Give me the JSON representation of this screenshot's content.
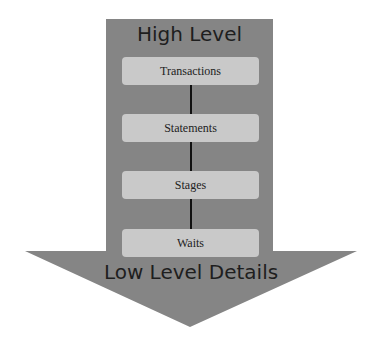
{
  "diagram": {
    "top_label": "High Level",
    "bottom_label": "Low Level Details",
    "levels": [
      {
        "label": "Transactions"
      },
      {
        "label": "Statements"
      },
      {
        "label": "Stages"
      },
      {
        "label": "Waits"
      }
    ],
    "colors": {
      "arrow_fill": "#858585",
      "box_fill": "#c9c9c9",
      "connector": "#111111",
      "text": "#1e1e1e"
    }
  }
}
